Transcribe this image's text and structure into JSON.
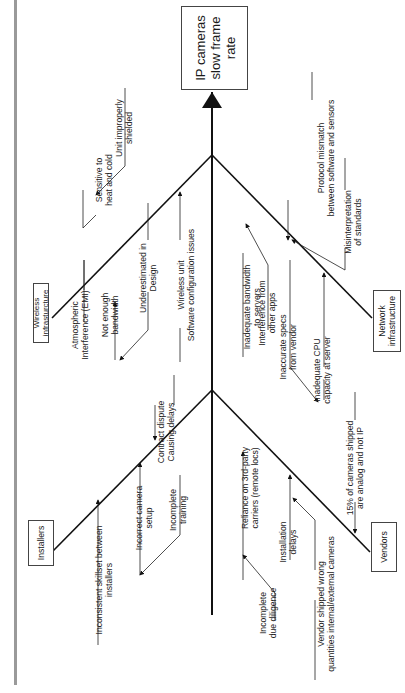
{
  "figure_title": "Figure 15.1",
  "head": {
    "label": "IP cameras slow frame rate",
    "lines": [
      "IP cameras",
      "slow frame",
      "rate"
    ]
  },
  "categories": {
    "wireless": {
      "label": "Wireless infrasturcture",
      "lines": [
        "Wireless",
        "infrasturcture"
      ]
    },
    "network": {
      "label": "Network infrastructure",
      "lines": [
        "Network",
        "infrastructure"
      ]
    },
    "installers": {
      "label": "Installers"
    },
    "vendors": {
      "label": "Vendors"
    }
  },
  "causes": {
    "wireless": [
      {
        "l1": "Sensitive to",
        "l2": "heat and cold"
      },
      {
        "l1": "Unit improperly",
        "l2": "shielded"
      },
      {
        "l1": "Atmospheric",
        "l2": "Interference (EMI)"
      },
      {
        "l1": "Not enough",
        "l2": "bandwidth"
      },
      {
        "l1": "Underestimated in",
        "l2": "Design"
      },
      {
        "l1": "Wireless unit",
        "l2": "Software configuration issues"
      }
    ],
    "network": [
      {
        "l1": "Protocol mismatch",
        "l2": "between software and sensors"
      },
      {
        "l1": "Misinterpretation",
        "l2": "of standards"
      },
      {
        "l1": "Inadequate bandwidth",
        "l2": "to servers"
      },
      {
        "l1": "Interference from",
        "l2": "other apps"
      },
      {
        "l1": "Inaccurate specs",
        "l2": "from vendor"
      },
      {
        "l1": "Inadequate  CPU",
        "l2": "capacity at server"
      }
    ],
    "installers": [
      {
        "l1": "Contract dispute",
        "l2": "Causing delays"
      },
      {
        "l1": "Inconsistent skillset between",
        "l2": "installers"
      },
      {
        "l1": "Incorrect camera",
        "l2": "setup"
      },
      {
        "l1": "Incomplete",
        "l2": "training"
      }
    ],
    "vendors": [
      {
        "l1": "15% of cameras shipped",
        "l2": "are analog and not IP"
      },
      {
        "l1": "Reliance on 3rd-party",
        "l2": "carriers (remote locs)"
      },
      {
        "l1": "Installation",
        "l2": "delays"
      },
      {
        "l1": "Incomplete",
        "l2": "due diligence"
      },
      {
        "l1": "Vendor shipped  wrong",
        "l2": "quantities internal/external cameras"
      }
    ]
  }
}
